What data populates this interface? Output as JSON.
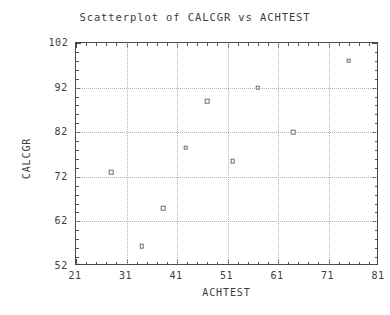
{
  "chart_data": {
    "type": "scatter",
    "title": "Scatterplot of CALCGR vs ACHTEST",
    "xlabel": "ACHTEST",
    "ylabel": "CALCGR",
    "xlim": [
      21,
      81
    ],
    "ylim": [
      52,
      102
    ],
    "grid": true,
    "legend": null,
    "x_ticks": [
      21,
      31,
      41,
      51,
      61,
      71,
      81
    ],
    "y_ticks": [
      52,
      62,
      72,
      82,
      92,
      102
    ],
    "x_tick_labels": [
      "21",
      "31",
      "41",
      "51",
      "61",
      "71",
      "81"
    ],
    "y_tick_labels": [
      "52",
      "62",
      "72",
      "82",
      "92",
      "102"
    ],
    "x_minor_interval": 2,
    "y_minor_interval": 2,
    "marker": "open-square",
    "marker_color": "#6e6e6e",
    "points": [
      {
        "x": 21.0,
        "y": 52.0
      },
      {
        "x": 28.0,
        "y": 73.0
      },
      {
        "x": 34.0,
        "y": 56.5
      },
      {
        "x": 38.3,
        "y": 65.0
      },
      {
        "x": 42.7,
        "y": 78.5
      },
      {
        "x": 47.0,
        "y": 89.0
      },
      {
        "x": 52.0,
        "y": 75.5
      },
      {
        "x": 57.0,
        "y": 92.0
      },
      {
        "x": 64.0,
        "y": 82.0
      },
      {
        "x": 75.0,
        "y": 98.0
      }
    ]
  }
}
